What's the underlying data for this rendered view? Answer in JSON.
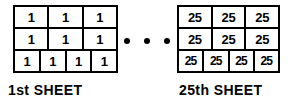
{
  "figure": {
    "sheets": [
      {
        "id": "first-sheet",
        "caption": "1st SHEET",
        "rows": [
          {
            "cells": [
              "1",
              "1",
              "1"
            ]
          },
          {
            "cells": [
              "1",
              "1",
              "1"
            ]
          },
          {
            "cells": [
              "1",
              "1",
              "1",
              "1"
            ]
          }
        ]
      },
      {
        "id": "twenty-fifth-sheet",
        "caption": "25th SHEET",
        "rows": [
          {
            "cells": [
              "25",
              "25",
              "25"
            ]
          },
          {
            "cells": [
              "25",
              "25",
              "25"
            ]
          },
          {
            "cells": [
              "25",
              "25",
              "25",
              "25"
            ]
          }
        ]
      }
    ],
    "ellipsis": {
      "name": "continuation-dots",
      "dot_count": 3
    },
    "colors": {
      "ink": "#000000",
      "background": "#ffffff"
    }
  }
}
